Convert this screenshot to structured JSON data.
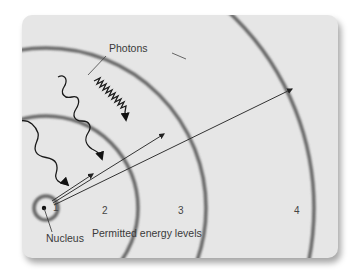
{
  "diagram": {
    "labels": {
      "photons": "Photons",
      "nucleus": "Nucleus",
      "permitted_energy_levels": "Permitted energy levels"
    },
    "energy_levels": [
      {
        "n": "1",
        "radius": 12
      },
      {
        "n": "2",
        "radius": 92
      },
      {
        "n": "3",
        "radius": 160
      },
      {
        "n": "4",
        "radius": 268
      }
    ],
    "photons_count": 3,
    "transition_arrows_count": 3,
    "colors": {
      "background": "#e6e6e6",
      "orbit": "#6a6a6a",
      "line": "#333333",
      "text": "#3a3a3a"
    }
  }
}
